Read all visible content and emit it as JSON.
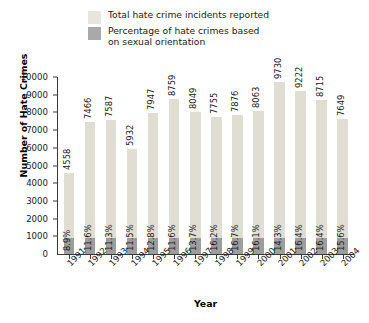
{
  "legend": {
    "items": [
      {
        "label": "Total hate crime incidents reported",
        "swatch": "total",
        "color": "#e8e5dc"
      },
      {
        "label": "Percentage of hate crimes based\non sexual orientation",
        "swatch": "pct",
        "color": "#a9a9a9"
      }
    ]
  },
  "axes": {
    "x_title": "Year",
    "y_title": "Number of Hate Crimes"
  },
  "chart_data": {
    "type": "bar",
    "title": "",
    "xlabel": "Year",
    "ylabel": "Number of Hate Crimes",
    "ylim": [
      0,
      10000
    ],
    "yticks": [
      0,
      1000,
      2000,
      3000,
      4000,
      5000,
      6000,
      7000,
      8000,
      9000,
      10000
    ],
    "ytick_labels": [
      "0",
      "1000",
      "2000",
      "3000",
      "4000",
      "5000",
      "6000",
      "7000",
      "8000",
      "9000",
      "10000"
    ],
    "grid": false,
    "legend_position": "top",
    "categories": [
      "1991",
      "1992",
      "1993",
      "1994",
      "1995",
      "1996",
      "1997",
      "1998",
      "1999",
      "2000",
      "2001",
      "2002",
      "2003",
      "2004"
    ],
    "series": [
      {
        "name": "Total hate crime incidents reported",
        "color": "#e0ddd3",
        "values": [
          4558,
          7466,
          7587,
          5932,
          7947,
          8759,
          8049,
          7755,
          7876,
          8063,
          9730,
          9222,
          8715,
          7649
        ],
        "labels": [
          "4558",
          "7466",
          "7587",
          "5932",
          "7947",
          "8759",
          "8049",
          "7755",
          "7876",
          "8063",
          "9730",
          "9222",
          "8715",
          "7649"
        ]
      },
      {
        "name": "Percentage of hate crimes based on sexual orientation",
        "color": "#9d9d9d",
        "values": [
          8.9,
          11.6,
          11.3,
          11.5,
          12.8,
          11.6,
          13.7,
          16.2,
          16.7,
          16.1,
          14.3,
          16.4,
          16.4,
          15.6
        ],
        "labels": [
          "8.9%",
          "11.6%",
          "11.3%",
          "11.5%",
          "12.8%",
          "11.6%",
          "13.7%",
          "16.2%",
          "16.7%",
          "16.1%",
          "14.3%",
          "16.4%",
          "16.4%",
          "15.6%"
        ]
      }
    ]
  }
}
